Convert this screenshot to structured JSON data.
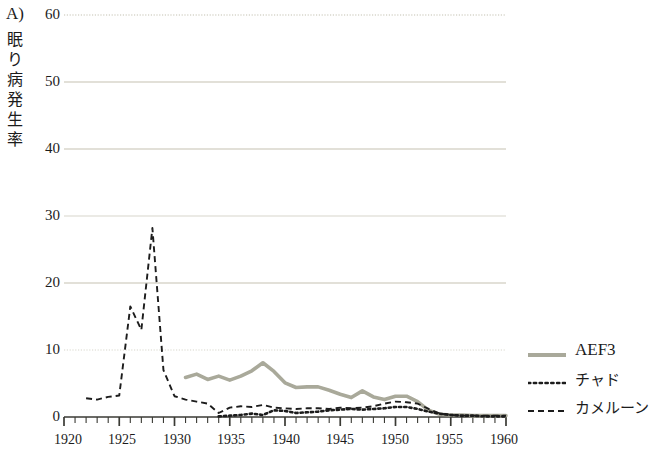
{
  "panel": {
    "label": "A)"
  },
  "axes": {
    "ylabel_chars": [
      "眠",
      "り",
      "病",
      "発",
      "生",
      "率"
    ],
    "ylabel_text": "眠り病発生率",
    "yticks": [
      0,
      10,
      20,
      30,
      40,
      50,
      60
    ],
    "ylim": [
      0,
      60
    ],
    "xticks": [
      1920,
      1925,
      1930,
      1935,
      1940,
      1945,
      1950,
      1955,
      1960
    ],
    "xlim": [
      1920,
      1960
    ],
    "xminor_step": 1,
    "grid": true,
    "grid_color": "#d8d6cb",
    "axis_color": "#3a3a34"
  },
  "legend": {
    "position": "right",
    "entries": [
      {
        "name": "AEF3",
        "style": "solid",
        "color": "#a9a99a",
        "script": "lat"
      },
      {
        "name": "チャド",
        "style": "dotted",
        "color": "#1c1c1c",
        "script": "jp"
      },
      {
        "name": "カメルーン",
        "style": "dashed",
        "color": "#1c1c1c",
        "script": "jp"
      }
    ]
  },
  "chart_data": {
    "type": "line",
    "title": "",
    "xlabel": "",
    "ylabel": "眠り病発生率",
    "xlim": [
      1920,
      1960
    ],
    "ylim": [
      0,
      60
    ],
    "yticks": [
      0,
      10,
      20,
      30,
      40,
      50,
      60
    ],
    "xticks": [
      1920,
      1925,
      1930,
      1935,
      1940,
      1945,
      1950,
      1955,
      1960
    ],
    "grid": true,
    "legend_position": "right",
    "series": [
      {
        "name": "AEF3",
        "style": "solid",
        "color": "#a9a99a",
        "x": [
          1931,
          1932,
          1933,
          1934,
          1935,
          1936,
          1937,
          1938,
          1939,
          1940,
          1941,
          1942,
          1943,
          1944,
          1945,
          1946,
          1947,
          1948,
          1949,
          1950,
          1951,
          1952,
          1953,
          1954,
          1955,
          1956,
          1957,
          1958,
          1959,
          1960
        ],
        "y": [
          5.9,
          6.4,
          5.6,
          6.1,
          5.5,
          6.1,
          6.9,
          8.1,
          6.8,
          5.1,
          4.4,
          4.5,
          4.5,
          4.0,
          3.4,
          2.9,
          3.9,
          3.0,
          2.6,
          3.1,
          3.1,
          2.3,
          1.0,
          0.4,
          0.3,
          0.3,
          0.2,
          0.2,
          0.2,
          0.2
        ]
      },
      {
        "name": "チャド",
        "style": "dotted",
        "color": "#1c1c1c",
        "x": [
          1934,
          1935,
          1936,
          1937,
          1938,
          1939,
          1940,
          1941,
          1942,
          1943,
          1944,
          1945,
          1946,
          1947,
          1948,
          1949,
          1950,
          1951,
          1952,
          1953,
          1954,
          1955,
          1956,
          1957,
          1958,
          1959,
          1960
        ],
        "y": [
          0.1,
          0.2,
          0.3,
          0.5,
          0.3,
          1.0,
          0.9,
          0.6,
          0.7,
          0.8,
          1.0,
          1.1,
          1.2,
          1.1,
          1.2,
          1.3,
          1.5,
          1.5,
          1.2,
          0.8,
          0.5,
          0.3,
          0.2,
          0.2,
          0.1,
          0.1,
          0.1
        ]
      },
      {
        "name": "カメルーン",
        "style": "dashed",
        "color": "#1c1c1c",
        "x": [
          1922,
          1923,
          1924,
          1925,
          1926,
          1927,
          1928,
          1929,
          1930,
          1931,
          1932,
          1933,
          1934,
          1935,
          1936,
          1937,
          1938,
          1939,
          1940,
          1941,
          1942,
          1943,
          1944,
          1945,
          1946,
          1947,
          1948,
          1949,
          1950,
          1951,
          1952,
          1953,
          1954,
          1955,
          1956,
          1957,
          1958,
          1959,
          1960
        ],
        "y": [
          2.8,
          2.6,
          3.0,
          3.2,
          16.5,
          13.0,
          28.2,
          7.0,
          3.1,
          2.6,
          2.3,
          2.0,
          0.6,
          1.4,
          1.6,
          1.5,
          1.8,
          1.4,
          1.3,
          1.2,
          1.3,
          1.3,
          1.2,
          1.4,
          1.3,
          1.4,
          1.6,
          2.0,
          2.3,
          2.2,
          2.0,
          1.2,
          0.5,
          0.3,
          0.2,
          0.2,
          0.2,
          0.2,
          0.2
        ]
      }
    ]
  }
}
